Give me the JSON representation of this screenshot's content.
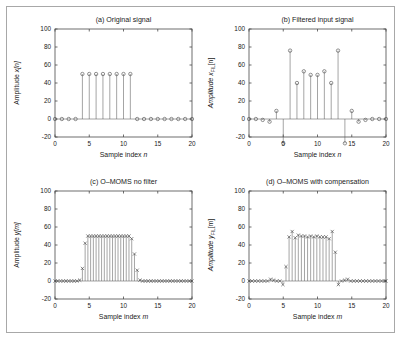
{
  "figure": {
    "width": 403,
    "height": 341,
    "background": "#ffffff",
    "frame_color": "#a8a8a8"
  },
  "chart_data": [
    {
      "id": "a",
      "type": "line",
      "plot_style": "stem",
      "marker": "circle",
      "title": "(a) Original signal",
      "xlabel": "Sample index n",
      "ylabel": "Amplitude x[n]",
      "xlim": [
        0,
        20
      ],
      "ylim": [
        -20,
        100
      ],
      "xticks": [
        0,
        5,
        10,
        15,
        20
      ],
      "yticks": [
        -20,
        0,
        20,
        40,
        60,
        80,
        100
      ],
      "grid": false,
      "x": [
        0,
        1,
        2,
        3,
        4,
        5,
        6,
        7,
        8,
        9,
        10,
        11,
        12,
        13,
        14,
        15,
        16,
        17,
        18,
        19,
        20
      ],
      "values": [
        0,
        0,
        0,
        0,
        50,
        50,
        50,
        50,
        50,
        50,
        50,
        50,
        0,
        0,
        0,
        0,
        0,
        0,
        0,
        0,
        0
      ]
    },
    {
      "id": "b",
      "type": "line",
      "plot_style": "stem",
      "marker": "circle",
      "title": "(b) Filtered input signal",
      "xlabel": "Sample index n",
      "ylabel": "Amplitude x_FIL[n]",
      "ylabel_main": "Amplitude x",
      "ylabel_sub": "FIL",
      "ylabel_tail": "[n]",
      "xlim": [
        0,
        20
      ],
      "ylim": [
        -20,
        100
      ],
      "xticks": [
        0,
        5,
        10,
        15,
        20
      ],
      "yticks": [
        -20,
        0,
        20,
        40,
        60,
        80,
        100
      ],
      "grid": false,
      "x": [
        0,
        1,
        2,
        3,
        4,
        5,
        6,
        7,
        8,
        9,
        10,
        11,
        12,
        13,
        14,
        15,
        16,
        17,
        18,
        19,
        20
      ],
      "values": [
        0,
        0,
        -1,
        -3,
        9,
        -27,
        76,
        40,
        53,
        49,
        49,
        53,
        40,
        76,
        -27,
        9,
        -3,
        -1,
        0,
        0,
        0
      ]
    },
    {
      "id": "c",
      "type": "line",
      "plot_style": "stem",
      "marker": "x",
      "title": "(c) O–MOMS no filter",
      "xlabel": "Sample index m",
      "ylabel": "Amplitude y[m]",
      "xlim": [
        0,
        20
      ],
      "ylim": [
        -20,
        100
      ],
      "xticks": [
        0,
        5,
        10,
        15,
        20
      ],
      "yticks": [
        -20,
        0,
        20,
        40,
        60,
        80,
        100
      ],
      "grid": false,
      "x": [
        0,
        0.4,
        0.8,
        1.2,
        1.6,
        2,
        2.4,
        2.8,
        3.2,
        3.6,
        4,
        4.4,
        4.8,
        5.2,
        5.6,
        6,
        6.4,
        6.8,
        7.2,
        7.6,
        8,
        8.4,
        8.8,
        9.2,
        9.6,
        10,
        10.4,
        10.8,
        11.2,
        11.6,
        12,
        12.4,
        12.8,
        13.2,
        13.6,
        14,
        14.4,
        14.8,
        15.2,
        15.6,
        16,
        16.4,
        16.8,
        17.2,
        17.6,
        18,
        18.4,
        18.8,
        19.2,
        19.6,
        20
      ],
      "values": [
        0,
        0,
        0,
        0,
        0,
        0,
        0,
        0,
        0,
        1,
        14,
        42,
        50,
        50,
        50,
        50,
        50,
        50,
        50,
        50,
        50,
        50,
        50,
        50,
        50,
        50,
        50,
        50,
        47,
        30,
        12,
        1,
        0,
        0,
        0,
        0,
        0,
        0,
        0,
        0,
        0,
        0,
        0,
        0,
        0,
        0,
        0,
        0,
        0,
        0,
        0
      ]
    },
    {
      "id": "d",
      "type": "line",
      "plot_style": "stem",
      "marker": "x",
      "title": "(d) O–MOMS with compensation",
      "xlabel": "Sample index m",
      "ylabel": "Amplitude y_FIL[m]",
      "ylabel_main": "Amplitude y",
      "ylabel_sub": "FIL",
      "ylabel_tail": "[m]",
      "xlim": [
        0,
        20
      ],
      "ylim": [
        -20,
        100
      ],
      "xticks": [
        0,
        5,
        10,
        15,
        20
      ],
      "yticks": [
        -20,
        0,
        20,
        40,
        60,
        80,
        100
      ],
      "grid": false,
      "x": [
        0,
        0.45,
        0.9,
        1.35,
        1.8,
        2.25,
        2.7,
        3.15,
        3.6,
        4.05,
        4.5,
        4.95,
        5.4,
        5.85,
        6.3,
        6.75,
        7.2,
        7.65,
        8.1,
        8.55,
        9,
        9.45,
        9.9,
        10.35,
        10.8,
        11.25,
        11.7,
        12.15,
        12.6,
        13.05,
        13.5,
        13.95,
        14.4,
        14.85,
        15.3,
        15.75,
        16.2,
        16.65,
        17.1,
        17.55,
        18,
        18.45,
        18.9,
        19.35,
        19.8,
        20
      ],
      "values": [
        0,
        0,
        0,
        0,
        0,
        0,
        0,
        2,
        1,
        0,
        0,
        -4,
        16,
        49,
        55,
        48,
        51,
        50,
        50,
        49,
        50,
        49,
        50,
        49,
        49,
        49,
        47,
        55,
        32,
        -4,
        0,
        1,
        2,
        0,
        0,
        0,
        0,
        0,
        0,
        0,
        0,
        0,
        0,
        0,
        0,
        0
      ]
    }
  ]
}
